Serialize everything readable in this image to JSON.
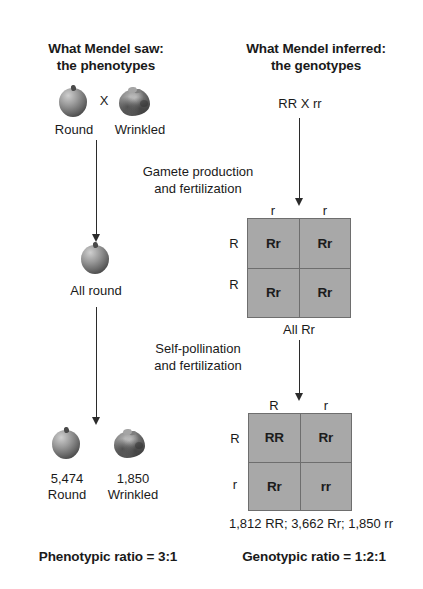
{
  "columns": {
    "left": {
      "title_line1": "What Mendel saw:",
      "title_line2": "the phenotypes"
    },
    "right": {
      "title_line1": "What Mendel inferred:",
      "title_line2": "the genotypes"
    }
  },
  "parents": {
    "left_pea_label": "Round",
    "cross_symbol": "X",
    "right_pea_label": "Wrinkled",
    "genotype_cross": "RR X rr"
  },
  "steps": {
    "step1_line1": "Gamete production",
    "step1_line2": "and fertilization",
    "step2_line1": "Self-pollination",
    "step2_line2": "and fertilization"
  },
  "f1": {
    "phenotype_label": "All round",
    "genotype_label": "All Rr"
  },
  "punnett1": {
    "col_headers": [
      "r",
      "r"
    ],
    "row_headers": [
      "R",
      "R"
    ],
    "cells": [
      [
        "Rr",
        "Rr"
      ],
      [
        "Rr",
        "Rr"
      ]
    ]
  },
  "punnett2": {
    "col_headers": [
      "R",
      "r"
    ],
    "row_headers": [
      "R",
      "r"
    ],
    "cells": [
      [
        "RR",
        "Rr"
      ],
      [
        "Rr",
        "rr"
      ]
    ]
  },
  "f2": {
    "round_count": "5,474",
    "round_label": "Round",
    "wrinkled_count": "1,850",
    "wrinkled_label": "Wrinkled",
    "genotype_counts": "1,812 RR; 3,662 Rr; 1,850 rr"
  },
  "conclusions": {
    "phenotypic_ratio": "Phenotypic ratio = 3:1",
    "genotypic_ratio": "Genotypic ratio = 1:2:1"
  },
  "colors": {
    "punnett_fill": "#a8a8a8",
    "punnett_border": "#6e6e6e",
    "text": "#1a1a1a",
    "arrow": "#2b2b2b"
  }
}
